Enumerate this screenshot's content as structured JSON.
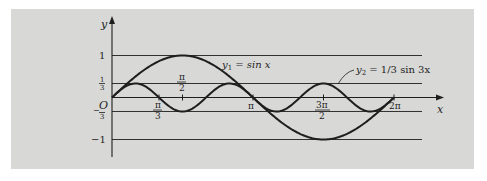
{
  "chart_data": {
    "type": "line",
    "title": "",
    "xlabel": "x",
    "ylabel": "y",
    "xlim": [
      0,
      6.2832
    ],
    "ylim": [
      -1,
      1
    ],
    "grid": false,
    "reference_lines_y": [
      1,
      0.3333,
      -0.3333,
      -1
    ],
    "x_ticks": [
      {
        "value": 1.0472,
        "label": "π/3",
        "position": "below"
      },
      {
        "value": 1.5708,
        "label": "π/2",
        "position": "above"
      },
      {
        "value": 3.1416,
        "label": "π",
        "position": "below"
      },
      {
        "value": 4.7124,
        "label": "3π/2",
        "position": "below"
      },
      {
        "value": 6.2832,
        "label": "2π",
        "position": "below"
      }
    ],
    "y_ticks": [
      {
        "value": 1,
        "label": "1"
      },
      {
        "value": 0.3333,
        "label": "1/3"
      },
      {
        "value": 0,
        "label": "O"
      },
      {
        "value": -0.3333,
        "label": "-1/3"
      },
      {
        "value": -1,
        "label": "-1"
      }
    ],
    "series": [
      {
        "name": "y1 = sin x",
        "function": "sin(x)",
        "amplitude": 1,
        "frequency": 1
      },
      {
        "name": "y2 = 1/3 sin 3x",
        "function": "(1/3) sin(3x)",
        "amplitude": 0.3333,
        "frequency": 3
      }
    ],
    "annotations": [
      {
        "text": "y1 = sin x",
        "near_x": 2.4,
        "near_y": 0.75
      },
      {
        "text": "y2 = 1/3 sin 3x",
        "near_x": 5.6,
        "near_y": 0.5,
        "leader_line": true
      }
    ]
  },
  "labels": {
    "y_axis": "y",
    "x_axis": "x",
    "origin": "O",
    "one": "1",
    "neg_one": "−1",
    "third_num": "1",
    "third_den": "3",
    "neg_third_sign": "−",
    "pi3_num": "π",
    "pi3_den": "3",
    "pi2_num": "π",
    "pi2_den": "2",
    "pi": "π",
    "threepi2_num": "3π",
    "threepi2_den": "2",
    "twopi": "2π",
    "y1_label_a": "y",
    "y1_label_sub": "1",
    "y1_label_b": " = sin x",
    "y2_label_a": "y",
    "y2_label_sub": "2",
    "y2_label_b": " = 1/3 sin 3x"
  },
  "colors": {
    "panel": "#d8d8d6",
    "ink": "#1e1e1e"
  }
}
